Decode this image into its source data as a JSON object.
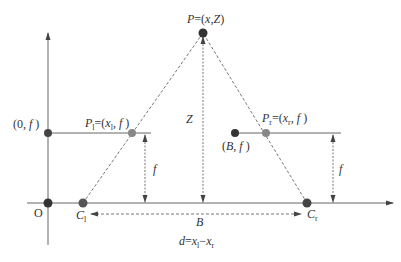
{
  "diagram": {
    "colors": {
      "line": "#666666",
      "dashed": "#777777",
      "point_dark": "#333333",
      "point_medium": "#555555",
      "point_light": "#888888",
      "text": "#333333"
    },
    "labels": {
      "P": {
        "main": "P",
        "eq": "=(",
        "x": "x",
        "comma": ",",
        "Z": "Z",
        "close": ")"
      },
      "origin": "O",
      "zero_f": {
        "open": "(0, ",
        "f": "f",
        "close": " )"
      },
      "B_f": {
        "open": "(",
        "B": "B",
        "comma": ", ",
        "f": "f",
        "close": " )"
      },
      "P_l": {
        "P": "P",
        "sub": "l",
        "eq": "=(",
        "x": "x",
        "xsub": "l",
        "comma": ", ",
        "f": "f",
        "close": " )"
      },
      "P_r": {
        "P": "P",
        "sub": "r",
        "eq": "=(",
        "x": "x",
        "xsub": "r",
        "comma": ", ",
        "f": "f",
        "close": " )"
      },
      "C_l": {
        "C": "C",
        "sub": "l"
      },
      "C_r": {
        "C": "C",
        "sub": "r"
      },
      "Z": "Z",
      "f_left": "f",
      "f_right": "f",
      "B": "B",
      "disparity": {
        "d": "d",
        "eq": "=",
        "xl": "x",
        "xlsub": "l",
        "minus": "−",
        "xr": "x",
        "xrsub": "r"
      }
    }
  }
}
